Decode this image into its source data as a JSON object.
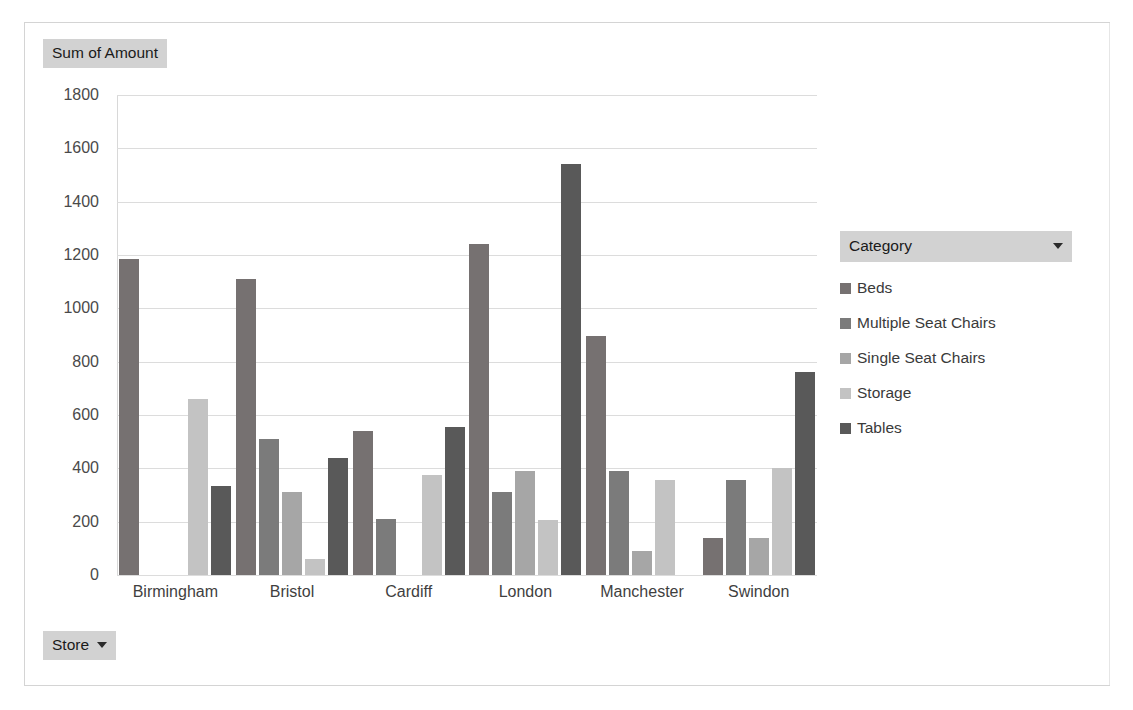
{
  "value_field_button": {
    "label": "Sum of Amount"
  },
  "store_field_button": {
    "label": "Store",
    "caret_icon": "caret-down-icon"
  },
  "legend": {
    "header_label": "Category",
    "header_caret_icon": "caret-down-icon",
    "items": [
      {
        "label": "Beds",
        "color": "#767171"
      },
      {
        "label": "Multiple Seat Chairs",
        "color": "#7b7b7b"
      },
      {
        "label": "Single Seat Chairs",
        "color": "#a6a6a6"
      },
      {
        "label": "Storage",
        "color": "#c3c3c3"
      },
      {
        "label": "Tables",
        "color": "#595959"
      }
    ]
  },
  "chart_data": {
    "type": "bar",
    "title": "Sum of Amount",
    "xlabel": "Store",
    "ylabel": "Sum of Amount",
    "ylim": [
      0,
      1800
    ],
    "ytick_step": 200,
    "yticks": [
      "1800",
      "1600",
      "1400",
      "1200",
      "1000",
      "800",
      "600",
      "400",
      "200",
      "0"
    ],
    "grid": true,
    "legend_position": "right",
    "legend_title": "Category",
    "categories": [
      "Birmingham",
      "Bristol",
      "Cardiff",
      "London",
      "Manchester",
      "Swindon"
    ],
    "series": [
      {
        "name": "Beds",
        "color": "#767171",
        "values": [
          1185,
          1110,
          540,
          1240,
          895,
          140
        ]
      },
      {
        "name": "Multiple Seat Chairs",
        "color": "#7b7b7b",
        "values": [
          null,
          510,
          210,
          310,
          390,
          355
        ]
      },
      {
        "name": "Single Seat Chairs",
        "color": "#a6a6a6",
        "values": [
          null,
          310,
          null,
          390,
          90,
          140
        ]
      },
      {
        "name": "Storage",
        "color": "#c3c3c3",
        "values": [
          660,
          60,
          375,
          205,
          355,
          400
        ]
      },
      {
        "name": "Tables",
        "color": "#595959",
        "values": [
          335,
          440,
          555,
          1540,
          null,
          760
        ]
      }
    ]
  }
}
